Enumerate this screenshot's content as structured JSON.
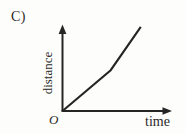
{
  "figure": {
    "panel_label": "C)",
    "origin_label": "O",
    "stroke_color": "#252525",
    "background_color": "#fdfdfb"
  },
  "chart_data": {
    "type": "line",
    "title": "",
    "subtitle": "",
    "xlabel": "time",
    "ylabel": "distance",
    "grid": false,
    "legend_position": "none",
    "axis_style": "arrow-headed schematic axes, unlabeled ticks",
    "origin_label": "O",
    "xlim": [
      0,
      1
    ],
    "ylim": [
      0,
      1
    ],
    "x_tick_labels": [],
    "y_tick_labels": [],
    "annotations": [],
    "series": [
      {
        "name": "distance vs time",
        "x": [
          0.0,
          0.44,
          0.715
        ],
        "y": [
          0.0,
          0.48,
          0.99
        ],
        "segment_slopes": [
          1.09,
          1.85
        ]
      }
    ]
  },
  "icons": {
    "y_axis_arrow": "arrow-up-icon",
    "x_axis_arrow": "arrow-right-icon"
  }
}
